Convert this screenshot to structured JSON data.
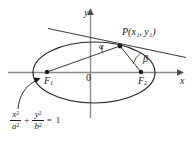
{
  "figure": {
    "kind": "ellipse-reflection-property-diagram",
    "axes": {
      "y_label": "y",
      "x_label": "x",
      "origin_label": "0"
    },
    "points": {
      "P": {
        "name": "P",
        "coords": "(x₁, y₁)",
        "x_sub": "1",
        "y_sub": "1"
      },
      "F1": {
        "name": "F",
        "sub": "1"
      },
      "F2": {
        "name": "F",
        "sub": "2"
      }
    },
    "angles": {
      "alpha": "α",
      "beta": "β"
    },
    "equation": {
      "term1_num": "x",
      "term1_num_pow": "2",
      "term1_den": "a",
      "term1_den_pow": "2",
      "plus": "+",
      "term2_num": "y",
      "term2_num_pow": "2",
      "term2_den": "b",
      "term2_den_pow": "2",
      "equals": "=",
      "rhs": "1"
    },
    "colors": {
      "ink": "#1a1a1a",
      "axis": "#8c8c8c",
      "curve": "#2b2b2b",
      "background": "#ffffff"
    }
  }
}
